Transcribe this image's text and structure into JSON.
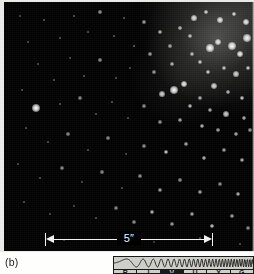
{
  "figure": {
    "panel_label": "(b)",
    "caption_present": false
  },
  "photo": {
    "name": "star-cluster-photograph",
    "description": "Dense star cluster field, concentration toward upper right",
    "background_color": "#000000",
    "star_color": "#ffffff",
    "print_border_color": "#e9e9e7"
  },
  "scale_bar": {
    "label": "5″",
    "value": 5,
    "unit": "arcsec",
    "color": "#f2f2f0"
  },
  "spectrum_indicator": {
    "name": "rivuxg-spectrum-bar",
    "background_color": "#cfcfc9",
    "line_color": "#1a1a1a",
    "bands": [
      {
        "letter": "R",
        "name": "radio"
      },
      {
        "letter": "I",
        "name": "infrared"
      },
      {
        "letter": "V",
        "name": "visible"
      },
      {
        "letter": "U",
        "name": "ultraviolet"
      },
      {
        "letter": "X",
        "name": "xray"
      },
      {
        "letter": "G",
        "name": "gamma"
      }
    ],
    "highlighted_band": "V"
  },
  "stars": [
    {
      "x": 32,
      "y": 106,
      "r": 4.2,
      "b": 1.0
    },
    {
      "x": 170,
      "y": 88,
      "r": 4.0,
      "b": 1.0
    },
    {
      "x": 180,
      "y": 82,
      "r": 3.2,
      "b": 0.95
    },
    {
      "x": 158,
      "y": 92,
      "r": 2.6,
      "b": 0.85
    },
    {
      "x": 206,
      "y": 46,
      "r": 3.6,
      "b": 1.0
    },
    {
      "x": 214,
      "y": 40,
      "r": 3.0,
      "b": 0.92
    },
    {
      "x": 228,
      "y": 44,
      "r": 4.4,
      "b": 1.0
    },
    {
      "x": 236,
      "y": 52,
      "r": 3.4,
      "b": 0.95
    },
    {
      "x": 243,
      "y": 36,
      "r": 3.8,
      "b": 0.98
    },
    {
      "x": 196,
      "y": 60,
      "r": 2.2,
      "b": 0.8
    },
    {
      "x": 188,
      "y": 52,
      "r": 2.0,
      "b": 0.75
    },
    {
      "x": 204,
      "y": 70,
      "r": 2.4,
      "b": 0.82
    },
    {
      "x": 220,
      "y": 66,
      "r": 2.0,
      "b": 0.78
    },
    {
      "x": 232,
      "y": 72,
      "r": 2.6,
      "b": 0.86
    },
    {
      "x": 244,
      "y": 66,
      "r": 2.2,
      "b": 0.8
    },
    {
      "x": 210,
      "y": 84,
      "r": 2.8,
      "b": 0.88
    },
    {
      "x": 224,
      "y": 90,
      "r": 2.0,
      "b": 0.74
    },
    {
      "x": 238,
      "y": 96,
      "r": 2.4,
      "b": 0.82
    },
    {
      "x": 196,
      "y": 96,
      "r": 1.8,
      "b": 0.7
    },
    {
      "x": 186,
      "y": 104,
      "r": 2.2,
      "b": 0.78
    },
    {
      "x": 206,
      "y": 108,
      "r": 2.0,
      "b": 0.72
    },
    {
      "x": 222,
      "y": 112,
      "r": 2.6,
      "b": 0.84
    },
    {
      "x": 240,
      "y": 116,
      "r": 2.0,
      "b": 0.74
    },
    {
      "x": 176,
      "y": 118,
      "r": 1.8,
      "b": 0.68
    },
    {
      "x": 198,
      "y": 124,
      "r": 2.2,
      "b": 0.76
    },
    {
      "x": 214,
      "y": 128,
      "r": 1.8,
      "b": 0.68
    },
    {
      "x": 232,
      "y": 132,
      "r": 2.0,
      "b": 0.72
    },
    {
      "x": 246,
      "y": 128,
      "r": 1.6,
      "b": 0.64
    },
    {
      "x": 190,
      "y": 16,
      "r": 2.6,
      "b": 0.9
    },
    {
      "x": 202,
      "y": 10,
      "r": 2.2,
      "b": 0.84
    },
    {
      "x": 216,
      "y": 18,
      "r": 2.8,
      "b": 0.92
    },
    {
      "x": 230,
      "y": 12,
      "r": 2.4,
      "b": 0.86
    },
    {
      "x": 242,
      "y": 20,
      "r": 3.0,
      "b": 0.94
    },
    {
      "x": 176,
      "y": 26,
      "r": 1.8,
      "b": 0.72
    },
    {
      "x": 186,
      "y": 34,
      "r": 2.0,
      "b": 0.76
    },
    {
      "x": 166,
      "y": 44,
      "r": 1.6,
      "b": 0.66
    },
    {
      "x": 156,
      "y": 30,
      "r": 1.8,
      "b": 0.7
    },
    {
      "x": 146,
      "y": 52,
      "r": 1.6,
      "b": 0.64
    },
    {
      "x": 168,
      "y": 62,
      "r": 1.8,
      "b": 0.7
    },
    {
      "x": 150,
      "y": 70,
      "r": 1.6,
      "b": 0.62
    },
    {
      "x": 140,
      "y": 20,
      "r": 1.6,
      "b": 0.64
    },
    {
      "x": 130,
      "y": 44,
      "r": 1.4,
      "b": 0.58
    },
    {
      "x": 120,
      "y": 16,
      "r": 1.4,
      "b": 0.56
    },
    {
      "x": 110,
      "y": 34,
      "r": 1.4,
      "b": 0.56
    },
    {
      "x": 96,
      "y": 10,
      "r": 1.6,
      "b": 0.62
    },
    {
      "x": 84,
      "y": 30,
      "r": 1.4,
      "b": 0.54
    },
    {
      "x": 70,
      "y": 14,
      "r": 1.4,
      "b": 0.56
    },
    {
      "x": 56,
      "y": 36,
      "r": 1.4,
      "b": 0.52
    },
    {
      "x": 40,
      "y": 18,
      "r": 1.4,
      "b": 0.54
    },
    {
      "x": 24,
      "y": 40,
      "r": 1.4,
      "b": 0.52
    },
    {
      "x": 16,
      "y": 14,
      "r": 1.2,
      "b": 0.48
    },
    {
      "x": 34,
      "y": 62,
      "r": 1.4,
      "b": 0.52
    },
    {
      "x": 50,
      "y": 78,
      "r": 1.4,
      "b": 0.54
    },
    {
      "x": 66,
      "y": 56,
      "r": 1.4,
      "b": 0.52
    },
    {
      "x": 80,
      "y": 74,
      "r": 1.4,
      "b": 0.54
    },
    {
      "x": 96,
      "y": 58,
      "r": 1.6,
      "b": 0.6
    },
    {
      "x": 112,
      "y": 76,
      "r": 1.4,
      "b": 0.54
    },
    {
      "x": 126,
      "y": 66,
      "r": 1.4,
      "b": 0.52
    },
    {
      "x": 18,
      "y": 88,
      "r": 1.4,
      "b": 0.54
    },
    {
      "x": 56,
      "y": 102,
      "r": 1.4,
      "b": 0.52
    },
    {
      "x": 76,
      "y": 96,
      "r": 1.6,
      "b": 0.58
    },
    {
      "x": 92,
      "y": 112,
      "r": 1.4,
      "b": 0.52
    },
    {
      "x": 108,
      "y": 100,
      "r": 1.4,
      "b": 0.54
    },
    {
      "x": 124,
      "y": 116,
      "r": 1.4,
      "b": 0.52
    },
    {
      "x": 140,
      "y": 104,
      "r": 1.6,
      "b": 0.6
    },
    {
      "x": 156,
      "y": 120,
      "r": 1.6,
      "b": 0.62
    },
    {
      "x": 22,
      "y": 126,
      "r": 1.4,
      "b": 0.52
    },
    {
      "x": 44,
      "y": 140,
      "r": 1.4,
      "b": 0.52
    },
    {
      "x": 64,
      "y": 132,
      "r": 1.6,
      "b": 0.58
    },
    {
      "x": 84,
      "y": 148,
      "r": 1.4,
      "b": 0.52
    },
    {
      "x": 104,
      "y": 136,
      "r": 1.6,
      "b": 0.58
    },
    {
      "x": 122,
      "y": 152,
      "r": 1.4,
      "b": 0.52
    },
    {
      "x": 140,
      "y": 144,
      "r": 1.6,
      "b": 0.6
    },
    {
      "x": 162,
      "y": 150,
      "r": 2.4,
      "b": 0.82
    },
    {
      "x": 182,
      "y": 142,
      "r": 1.8,
      "b": 0.68
    },
    {
      "x": 200,
      "y": 156,
      "r": 2.2,
      "b": 0.76
    },
    {
      "x": 220,
      "y": 148,
      "r": 1.8,
      "b": 0.66
    },
    {
      "x": 238,
      "y": 158,
      "r": 2.0,
      "b": 0.72
    },
    {
      "x": 14,
      "y": 162,
      "r": 1.4,
      "b": 0.52
    },
    {
      "x": 36,
      "y": 176,
      "r": 1.4,
      "b": 0.52
    },
    {
      "x": 58,
      "y": 166,
      "r": 1.6,
      "b": 0.58
    },
    {
      "x": 78,
      "y": 180,
      "r": 1.4,
      "b": 0.52
    },
    {
      "x": 98,
      "y": 170,
      "r": 1.6,
      "b": 0.58
    },
    {
      "x": 118,
      "y": 186,
      "r": 1.4,
      "b": 0.52
    },
    {
      "x": 136,
      "y": 174,
      "r": 1.6,
      "b": 0.6
    },
    {
      "x": 156,
      "y": 188,
      "r": 1.8,
      "b": 0.66
    },
    {
      "x": 176,
      "y": 178,
      "r": 1.6,
      "b": 0.6
    },
    {
      "x": 196,
      "y": 190,
      "r": 1.8,
      "b": 0.68
    },
    {
      "x": 216,
      "y": 182,
      "r": 1.6,
      "b": 0.58
    },
    {
      "x": 234,
      "y": 192,
      "r": 2.0,
      "b": 0.72
    },
    {
      "x": 20,
      "y": 200,
      "r": 1.4,
      "b": 0.5
    },
    {
      "x": 46,
      "y": 212,
      "r": 1.4,
      "b": 0.5
    },
    {
      "x": 70,
      "y": 204,
      "r": 1.4,
      "b": 0.52
    },
    {
      "x": 92,
      "y": 216,
      "r": 1.4,
      "b": 0.5
    },
    {
      "x": 112,
      "y": 206,
      "r": 1.6,
      "b": 0.56
    },
    {
      "x": 130,
      "y": 220,
      "r": 1.6,
      "b": 0.58
    },
    {
      "x": 148,
      "y": 210,
      "r": 2.2,
      "b": 0.76
    },
    {
      "x": 168,
      "y": 222,
      "r": 1.8,
      "b": 0.64
    },
    {
      "x": 188,
      "y": 212,
      "r": 2.0,
      "b": 0.7
    },
    {
      "x": 208,
      "y": 224,
      "r": 2.4,
      "b": 0.8
    },
    {
      "x": 228,
      "y": 214,
      "r": 1.8,
      "b": 0.66
    },
    {
      "x": 244,
      "y": 226,
      "r": 1.6,
      "b": 0.58
    },
    {
      "x": 60,
      "y": 238,
      "r": 1.2,
      "b": 0.44
    },
    {
      "x": 150,
      "y": 240,
      "r": 1.2,
      "b": 0.44
    },
    {
      "x": 196,
      "y": 236,
      "r": 1.4,
      "b": 0.5
    },
    {
      "x": 236,
      "y": 242,
      "r": 1.4,
      "b": 0.5
    }
  ]
}
